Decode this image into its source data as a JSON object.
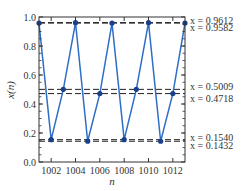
{
  "chart_data": {
    "type": "line",
    "title": "",
    "xlabel": "n",
    "ylabel": "x(n)",
    "xlim": [
      1001,
      1013
    ],
    "ylim": [
      0.0,
      1.0
    ],
    "grid": false,
    "x_ticks": [
      "1002",
      "1004",
      "1006",
      "1008",
      "1010",
      "1012"
    ],
    "x_tick_values": [
      1002,
      1004,
      1006,
      1008,
      1010,
      1012
    ],
    "y_ticks": [
      "0.0",
      "0.2",
      "0.4",
      "0.6",
      "0.8",
      "1.0"
    ],
    "y_tick_values": [
      0.0,
      0.2,
      0.4,
      0.6,
      0.8,
      1.0
    ],
    "series": [
      {
        "name": "x(n)",
        "color": "#2f6ec7",
        "marker_color": "#1a3f8a",
        "x": [
          1001,
          1002,
          1003,
          1004,
          1005,
          1006,
          1007,
          1008,
          1009,
          1010,
          1011,
          1012,
          1013
        ],
        "values": [
          0.9582,
          0.154,
          0.5009,
          0.9612,
          0.1432,
          0.4718,
          0.9582,
          0.154,
          0.5009,
          0.9612,
          0.1432,
          0.4718,
          0.9582
        ]
      }
    ],
    "reference_lines": [
      {
        "y": 0.9612,
        "label": "x = 0.9612",
        "color": "#222222"
      },
      {
        "y": 0.9582,
        "label": "x = 0.9582",
        "color": "#222222"
      },
      {
        "y": 0.5009,
        "label": "x = 0.5009",
        "color": "#222222"
      },
      {
        "y": 0.4718,
        "label": "x = 0.4718",
        "color": "#222222"
      },
      {
        "y": 0.154,
        "label": "x = 0.1540",
        "color": "#222222"
      },
      {
        "y": 0.1432,
        "label": "x = 0.1432",
        "color": "#222222"
      }
    ]
  }
}
